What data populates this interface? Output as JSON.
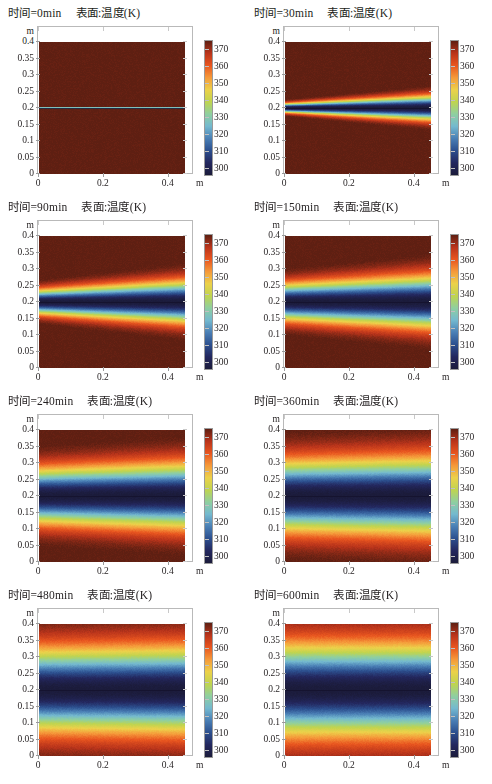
{
  "figure": {
    "columns": 2,
    "rows": 4,
    "axis_units": "m",
    "subtitle": "表面:温度(K)"
  },
  "chart_data": {
    "type": "heatmap",
    "title": "表面:温度(K)",
    "xlabel": "m",
    "ylabel": "m",
    "xlim": [
      0,
      0.45
    ],
    "ylim": [
      0,
      0.4
    ],
    "xticks": [
      "0",
      "0.2",
      "0.4"
    ],
    "yticks": [
      "0.4",
      "0.35",
      "0.3",
      "0.25",
      "0.2",
      "0.15",
      "0.1",
      "0.05",
      "0"
    ],
    "colorbar": {
      "label": "温度(K)",
      "ticks": [
        "370",
        "360",
        "350",
        "340",
        "330",
        "320",
        "310",
        "300"
      ],
      "vmin": 295,
      "vmax": 375,
      "colormap": "jet-like",
      "stops": [
        "#5e1f12",
        "#b9341b",
        "#e8551f",
        "#f5993a",
        "#ecd14a",
        "#bfd44f",
        "#8fcfa0",
        "#74b9cf",
        "#4a7fb5",
        "#2c4f8e",
        "#23275e",
        "#1b1b3a"
      ]
    },
    "panels": [
      {
        "id": "panel-0min",
        "time_label": "时间=0min",
        "time_minutes": 0,
        "subtitle": "表面:温度(K)",
        "cold_band_center_m": 0.2,
        "cold_band_halfwidth_m": 0.002,
        "wedge_taper": 0.0,
        "peak_temp_K": 373,
        "min_temp_K": 300
      },
      {
        "id": "panel-30min",
        "time_label": "时间=30min",
        "time_minutes": 30,
        "subtitle": "表面:温度(K)",
        "cold_band_center_m": 0.2,
        "cold_band_halfwidth_m": 0.032,
        "wedge_taper": 0.62,
        "peak_temp_K": 373,
        "min_temp_K": 297
      },
      {
        "id": "panel-90min",
        "time_label": "时间=90min",
        "time_minutes": 90,
        "subtitle": "表面:温度(K)",
        "cold_band_center_m": 0.2,
        "cold_band_halfwidth_m": 0.055,
        "wedge_taper": 0.42,
        "peak_temp_K": 371,
        "min_temp_K": 297
      },
      {
        "id": "panel-150min",
        "time_label": "时间=150min",
        "time_minutes": 150,
        "subtitle": "表面:温度(K)",
        "cold_band_center_m": 0.2,
        "cold_band_halfwidth_m": 0.068,
        "wedge_taper": 0.3,
        "peak_temp_K": 370,
        "min_temp_K": 298
      },
      {
        "id": "panel-240min",
        "time_label": "时间=240min",
        "time_minutes": 240,
        "subtitle": "表面:温度(K)",
        "cold_band_center_m": 0.2,
        "cold_band_halfwidth_m": 0.085,
        "wedge_taper": 0.16,
        "peak_temp_K": 369,
        "min_temp_K": 300
      },
      {
        "id": "panel-360min",
        "time_label": "时间=360min",
        "time_minutes": 360,
        "subtitle": "表面:温度(K)",
        "cold_band_center_m": 0.2,
        "cold_band_halfwidth_m": 0.1,
        "wedge_taper": 0.08,
        "peak_temp_K": 367,
        "min_temp_K": 302
      },
      {
        "id": "panel-480min",
        "time_label": "时间=480min",
        "time_minutes": 480,
        "subtitle": "表面:温度(K)",
        "cold_band_center_m": 0.2,
        "cold_band_halfwidth_m": 0.112,
        "wedge_taper": 0.04,
        "peak_temp_K": 366,
        "min_temp_K": 303
      },
      {
        "id": "panel-600min",
        "time_label": "时间=600min",
        "time_minutes": 600,
        "subtitle": "表面:温度(K)",
        "cold_band_center_m": 0.2,
        "cold_band_halfwidth_m": 0.12,
        "wedge_taper": 0.0,
        "peak_temp_K": 365,
        "min_temp_K": 304
      }
    ]
  }
}
